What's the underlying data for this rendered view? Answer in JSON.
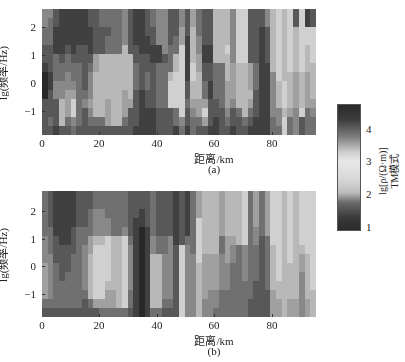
{
  "figure": {
    "panel_a": {
      "label": "(a)",
      "xlabel": "距离/km",
      "ylabel": "lg(频率/Hz)"
    },
    "panel_b": {
      "label": "(b)",
      "xlabel": "距离/km",
      "ylabel": "lg(频率/Hz)"
    },
    "xticks": [
      "0",
      "20",
      "40",
      "60",
      "80"
    ],
    "yticks": [
      "2",
      "1",
      "0",
      "−1"
    ],
    "colorbar": {
      "ticks": [
        "4",
        "3",
        "2",
        "1"
      ],
      "label_line1": "lg[ρ/(Ω·m)]",
      "label_line2": "TM模式"
    }
  },
  "chart_data": [
    {
      "type": "heatmap",
      "title": "(a)",
      "xlabel": "距离/km",
      "ylabel": "lg(频率/Hz)",
      "xlim": [
        0,
        96
      ],
      "ylim": [
        -1.85,
        2.65
      ],
      "xticks": [
        0,
        20,
        40,
        60,
        80
      ],
      "yticks": [
        2,
        1,
        0,
        -1
      ],
      "colorbar": {
        "label": "lg[ρ/(Ω·m)] TM模式",
        "range": [
          0.8,
          4.8
        ],
        "ticks": [
          1,
          2,
          3,
          4
        ],
        "colormap": "gray, dark at both ends, light near 3"
      },
      "grid": {
        "columns": 48,
        "rows": 14,
        "cell_km": 2,
        "note": "gray level 0 (black) to 9 (white), rows listed top (high freq) to bottom"
      },
      "gray": [
        "44332210002222",
        "43332221122232",
        "22111333442221",
        "11111233446662",
        "11112334455532",
        "11111233457743",
        "11112233333332",
        "11112222234222",
        "22111234445432",
        "22222556666632",
        "33222666666632",
        "33233666665552",
        "33333666666662",
        "33333666666662",
        "44446666655532",
        "22222666665222",
        "11112233322221",
        "11111222211111",
        "22211223322111",
        "33221122222111",
        "44441133333222",
        "44444233333222",
        "22223336777222",
        "22233667777331",
        "44557777777743",
        "22211111223221",
        "55666677665433",
        "33344556665532",
        "22221122335752",
        "22221122112221",
        "66666633332211",
        "66666633333222",
        "66667666555432",
        "44444455554221",
        "77777766666322",
        "77777766666632",
        "22222255565321",
        "22222233322211",
        "22111111111111",
        "44222211111111",
        "66666664444433",
        "77777777666443",
        "66666666777677",
        "77777776666533",
        "22666665555444",
        "77777776666722",
        "11776665555333",
        "22777766665433"
      ]
    },
    {
      "type": "heatmap",
      "title": "(b)",
      "xlabel": "距离/km",
      "ylabel": "lg(频率/Hz)",
      "xlim": [
        0,
        96
      ],
      "ylim": [
        -1.85,
        2.65
      ],
      "xticks": [
        0,
        20,
        40,
        60,
        80
      ],
      "yticks": [
        2,
        1,
        0,
        -1
      ],
      "grid": {
        "columns": 48,
        "rows": 14,
        "cell_km": 2,
        "note": "gray level 0 (black) to 9 (white), rows listed top (high freq) to bottom"
      },
      "gray": [
        "33333444555532",
        "22223334444432",
        "11111222333332",
        "11111122223332",
        "11111122233332",
        "11112223333332",
        "22223333333332",
        "22223344444322",
        "22333556666632",
        "33444677777752",
        "33444677777753",
        "33344777776553",
        "33333666666553",
        "33333666666663",
        "33334777777773",
        "22222344444332",
        "22211111111111",
        "22110000000000",
        "22221111111111",
        "33333446666663",
        "22222336666663",
        "22222334444432",
        "22222444444432",
        "11111122222222",
        "22222277777777",
        "11111344444444",
        "33333334444444",
        "55577777666666",
        "66666665555544",
        "66666665555444",
        "66666665555443",
        "55555334444333",
        "66666555444333",
        "66666544333333",
        "66666633333333",
        "77777744443333",
        "33333333333322",
        "55554433332222",
        "33333222222222",
        "55555333333222",
        "77777766666555",
        "77777777776655",
        "66666666666666",
        "77777777666655",
        "66666666666655",
        "77777765544444",
        "77777776666655",
        "77777777777666"
      ]
    }
  ]
}
